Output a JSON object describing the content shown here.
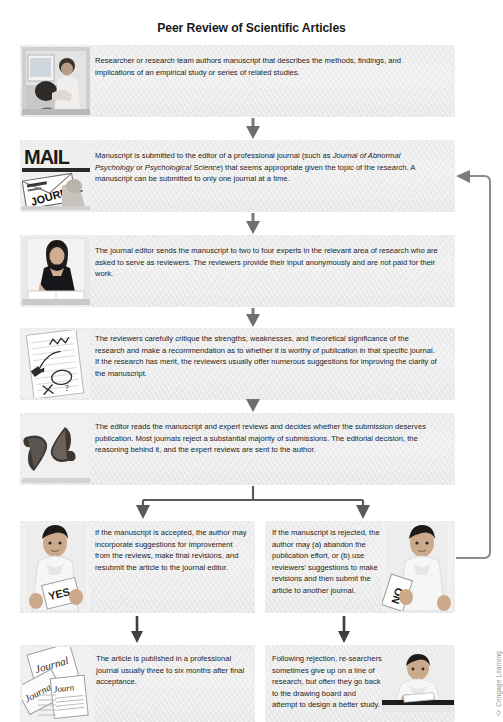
{
  "figure": {
    "title": "Peer Review of Scientific Articles",
    "credit": "© Cengage Learning"
  },
  "steps": [
    {
      "id": "authoring",
      "photo_name": "researchers-at-computer-photo",
      "text": "Researcher or research team authors manuscript that describes the methods, findings, and implications of an empirical study or series of related studies."
    },
    {
      "id": "submission",
      "photo_name": "mail-journal-envelope-photo",
      "text_part1": "Manuscript is submitted to the editor of a professional journal (such as ",
      "italic1": "Journal of Abnormal Psychology",
      "text_part2": " or ",
      "italic2": "Psychological Science",
      "text_part3": ") that seems appropriate given the topic of the research. A manuscript can be submitted to only one journal at a time."
    },
    {
      "id": "editor-sends",
      "photo_name": "editor-woman-reading-photo",
      "text": "The journal editor sends the manuscript to two to four experts in the relevant area of research who are asked to serve as reviewers. The reviewers provide their input anonymously and are not paid for their work."
    },
    {
      "id": "reviewers-critique",
      "photo_name": "marked-up-manuscript-photo",
      "text": "The reviewers carefully critique the strengths, weaknesses, and theoretical significance of the research and make a recommendation as to whether it is worthy of publication in that specific journal. If the research has merit, the reviewers usually offer numerous suggestions for improving the clarity of the manuscript."
    },
    {
      "id": "editor-decides",
      "photo_name": "thumbs-up-thumbs-down-photo",
      "text": "The editor reads the manuscript and expert reviews and decides whether the submission deserves publication. Most journals reject a substantial majority of submissions. The editorial decision, the reasoning behind it, and the expert reviews are sent to the author."
    }
  ],
  "branches": {
    "accepted": {
      "id": "accepted-branch",
      "photo_name": "man-holding-yes-sign-photo",
      "sign_label": "YES",
      "text": "If the manuscript is accepted, the author may incorporate suggestions for improvement from the reviews, make final revisions, and resubmit the article to the journal editor."
    },
    "rejected": {
      "id": "rejected-branch",
      "photo_name": "man-holding-no-sign-photo",
      "sign_label": "NO",
      "text": "If the manuscript is rejected, the author may (a) abandon the publication effort, or (b) use reviewers' suggestions to make revisions and then submit the article to another journal."
    }
  },
  "outcomes": {
    "published": {
      "id": "published-outcome",
      "photo_name": "stack-of-journals-photo",
      "journal_label": "Journal",
      "text": "The article is published in a professional journal usually three to six months after final acceptance."
    },
    "redesign": {
      "id": "redesign-outcome",
      "photo_name": "researcher-at-desk-photo",
      "text": "Following rejection, re-searchers sometimes give up on a line of research, but often they go back to the drawing board and attempt to design a better study."
    }
  },
  "photo_labels": {
    "mail": "MAIL",
    "journal": "JOURNAL"
  },
  "colors": {
    "box_fill": "#ececec",
    "arrow": "#555555",
    "title_text": "#1a1a1a",
    "body_text": "#1d1d1d",
    "credit_text": "#8d8d8d"
  }
}
